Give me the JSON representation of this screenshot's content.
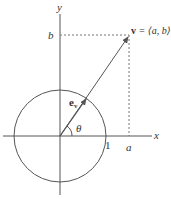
{
  "diagram": {
    "axes": {
      "x_label": "x",
      "y_label": "y"
    },
    "labels": {
      "b": "b",
      "a": "a",
      "one": "1",
      "theta": "θ",
      "ev_main": "e",
      "ev_sub": "v",
      "v_bold": "v",
      "v_rest": " = ⟨a, b⟩"
    },
    "elements": {
      "unit_circle": "circle of radius 1 centered at origin",
      "vector_v": "arrow from origin to (a, b)",
      "unit_vector_ev": "unit vector e_v along v",
      "angle": "theta between x-axis and v"
    },
    "colors": {
      "line": "#555555",
      "dashed": "#777777",
      "text": "#333333"
    }
  }
}
